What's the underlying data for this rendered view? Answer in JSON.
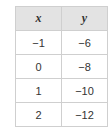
{
  "table": {
    "headers": [
      "x",
      "y"
    ],
    "rows": [
      [
        "−1",
        "−6"
      ],
      [
        "0",
        "−8"
      ],
      [
        "1",
        "−10"
      ],
      [
        "2",
        "−12"
      ]
    ]
  },
  "colors": {
    "header_bg": "#e3e3e3",
    "border": "#cfcfcf",
    "text": "#333333"
  }
}
